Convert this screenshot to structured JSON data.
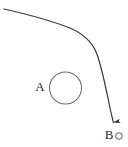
{
  "figure": {
    "canvas": {
      "width": 128,
      "height": 147,
      "background": "#ffffff"
    },
    "labels": {
      "circle_a": "A",
      "point_b": "B"
    },
    "colors": {
      "stroke": "#3a3a3a",
      "circle_stroke": "#6b6b6b",
      "label_text": "#2b2b2b",
      "background": "#ffffff"
    },
    "elements": {
      "trajectory": {
        "name": "curved-arrow-path",
        "start": {
          "x": 4,
          "y": 9
        },
        "end": {
          "x": 114,
          "y": 123
        },
        "waypoints": [
          {
            "x": 4,
            "y": 9
          },
          {
            "x": 40,
            "y": 19
          },
          {
            "x": 70,
            "y": 28
          },
          {
            "x": 88,
            "y": 40
          },
          {
            "x": 97,
            "y": 54
          },
          {
            "x": 105,
            "y": 80
          },
          {
            "x": 112,
            "y": 110
          },
          {
            "x": 114,
            "y": 123
          }
        ],
        "arrowhead": "down",
        "stroke_width": 1.2
      },
      "circle_a": {
        "name": "circle-a",
        "center": {
          "x": 65.5,
          "y": 88
        },
        "radius": 16,
        "stroke_width": 1,
        "filled": false
      },
      "label_a": {
        "name": "label-a",
        "position": {
          "x": 40,
          "y": 88
        }
      },
      "point_b_marker": {
        "name": "point-b-circle",
        "center": {
          "x": 119,
          "y": 136
        },
        "radius": 3.2,
        "stroke_width": 1,
        "filled": false
      },
      "label_b": {
        "name": "label-b",
        "position": {
          "x": 109,
          "y": 136
        }
      }
    }
  }
}
